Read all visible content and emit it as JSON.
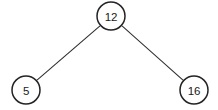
{
  "diagram": {
    "type": "binary-tree",
    "background_color": "#ffffff",
    "node_fill_color": "#ffffff",
    "node_stroke_color": "#232323",
    "edge_color": "#2b2b2b",
    "label_color": "#1a1a1a",
    "nodes": [
      {
        "id": "root",
        "label": "12",
        "role": "root",
        "cx": 111,
        "cy": 16,
        "r": 14
      },
      {
        "id": "left",
        "label": "5",
        "role": "left-child",
        "cx": 26,
        "cy": 90,
        "r": 14
      },
      {
        "id": "right",
        "label": "16",
        "role": "right-child",
        "cx": 194,
        "cy": 90,
        "r": 14
      }
    ],
    "edges": [
      {
        "id": "root-left",
        "from": "root",
        "to": "left",
        "x1": 100.0,
        "y1": 25.8,
        "x2": 37.0,
        "y2": 80.2
      },
      {
        "id": "root-right",
        "from": "root",
        "to": "right",
        "x1": 122.0,
        "y1": 25.8,
        "x2": 183.0,
        "y2": 80.2
      }
    ]
  }
}
